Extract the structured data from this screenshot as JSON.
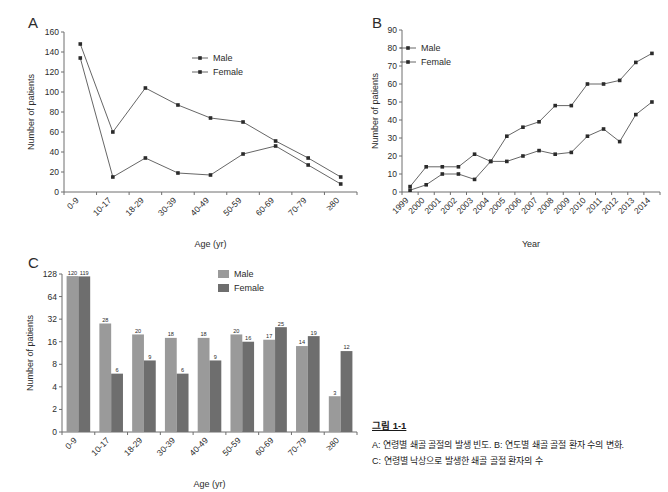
{
  "figure": {
    "panel_a_letter": "A",
    "panel_b_letter": "B",
    "panel_c_letter": "C"
  },
  "caption": {
    "title": "그림 1-1",
    "line1": "A: 연령별 쇄골 골절의 발생 빈도. B: 연도별 쇄골 골절 환자 수의 변화.",
    "line2": "C: 연령별 낙상으로 발생한 쇄골 골절 환자의 수"
  },
  "colors": {
    "male_bar": "#9a9a9a",
    "female_bar": "#6e6e6e",
    "line": "#555555",
    "marker": "#2b2b2b",
    "axis": "#6e6e6e"
  },
  "chart_data": [
    {
      "id": "panel-a",
      "type": "line",
      "title": "A",
      "xlabel": "Age (yr)",
      "ylabel": "Number of patients",
      "categories": [
        "0-9",
        "10-17",
        "18-29",
        "30-39",
        "40-49",
        "50-59",
        "60-69",
        "70-79",
        "≥80"
      ],
      "ylim": [
        0,
        160
      ],
      "yticks": [
        0,
        20,
        40,
        60,
        80,
        100,
        120,
        140,
        160
      ],
      "grid": false,
      "legend_position": "upper-right",
      "series": [
        {
          "name": "Male",
          "values": [
            148,
            60,
            104,
            87,
            74,
            70,
            51,
            34,
            15
          ]
        },
        {
          "name": "Female",
          "values": [
            134,
            15,
            34,
            19,
            17,
            38,
            46,
            27,
            8
          ]
        }
      ]
    },
    {
      "id": "panel-b",
      "type": "line",
      "title": "B",
      "xlabel": "Year",
      "ylabel": "Number of patients",
      "categories": [
        "1999",
        "2000",
        "2001",
        "2002",
        "2003",
        "2004",
        "2005",
        "2006",
        "2007",
        "2008",
        "2009",
        "2010",
        "2011",
        "2012",
        "2013",
        "2014"
      ],
      "ylim": [
        0,
        90
      ],
      "yticks": [
        0,
        10,
        20,
        30,
        40,
        50,
        60,
        70,
        80,
        90
      ],
      "grid": false,
      "legend_position": "upper-left",
      "series": [
        {
          "name": "Male",
          "values": [
            3,
            14,
            14,
            14,
            21,
            17,
            31,
            36,
            39,
            48,
            48,
            60,
            60,
            62,
            72,
            77
          ]
        },
        {
          "name": "Female",
          "values": [
            1,
            4,
            10,
            10,
            7,
            17,
            17,
            20,
            23,
            21,
            22,
            31,
            35,
            28,
            43,
            50
          ]
        }
      ]
    },
    {
      "id": "panel-c",
      "type": "bar",
      "title": "C",
      "xlabel": "Age (yr)",
      "ylabel": "Number of patients",
      "categories": [
        "0-9",
        "10-17",
        "18-29",
        "30-39",
        "40-49",
        "50-59",
        "60-69",
        "70-79",
        "≥80"
      ],
      "yscale": "log2",
      "yticks": [
        0,
        2,
        4,
        8,
        16,
        32,
        64,
        128
      ],
      "ylim": [
        0,
        128
      ],
      "grid": false,
      "legend_position": "upper-right",
      "series": [
        {
          "name": "Male",
          "values": [
            120,
            28,
            20,
            18,
            18,
            20,
            17,
            14,
            3
          ]
        },
        {
          "name": "Female",
          "values": [
            119,
            6,
            9,
            6,
            9,
            16,
            25,
            19,
            12
          ]
        }
      ]
    }
  ],
  "legend": {
    "male_label": "Male",
    "female_label": "Female"
  }
}
